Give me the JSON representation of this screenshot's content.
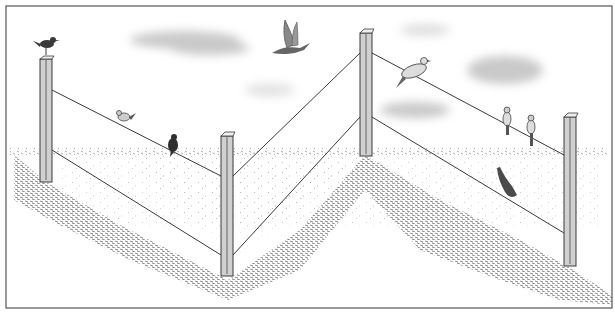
{
  "illustration": {
    "title": "Birds perched on a wire fence in a field",
    "colors": {
      "frame": "#555555",
      "ink": "#3a3a3a",
      "post_fill": "#cfcfcf",
      "cloud": "#bdbdbd",
      "ground_stipple": "#6a6a6a",
      "bird_dark": "#2e2e2e",
      "bird_mid": "#8a8a8a"
    },
    "posts": [
      {
        "id": "post-1",
        "x": 40,
        "top": 57,
        "bottom": 182,
        "wire_y": [
          90,
          150
        ]
      },
      {
        "id": "post-2",
        "x": 221,
        "top": 133,
        "bottom": 276,
        "wire_y": [
          176,
          255
        ]
      },
      {
        "id": "post-3",
        "x": 360,
        "top": 30,
        "bottom": 156,
        "wire_y": [
          53,
          117
        ]
      },
      {
        "id": "post-4",
        "x": 564,
        "top": 114,
        "bottom": 266,
        "wire_y": [
          155,
          233
        ]
      }
    ],
    "birds": [
      {
        "id": "bird-on-post",
        "label": "small bird perched on first post top"
      },
      {
        "id": "bird-wire-small",
        "label": "small bird on upper wire"
      },
      {
        "id": "bird-dark",
        "label": "dark bird on upper wire"
      },
      {
        "id": "bird-flying",
        "label": "bird in flight"
      },
      {
        "id": "bird-dove",
        "label": "dove on upper wire"
      },
      {
        "id": "bird-pair-1",
        "label": "small bird facing away on wire"
      },
      {
        "id": "bird-pair-2",
        "label": "small bird facing away on wire"
      },
      {
        "id": "bird-lower-wire",
        "label": "bird hanging on lower wire"
      }
    ]
  }
}
